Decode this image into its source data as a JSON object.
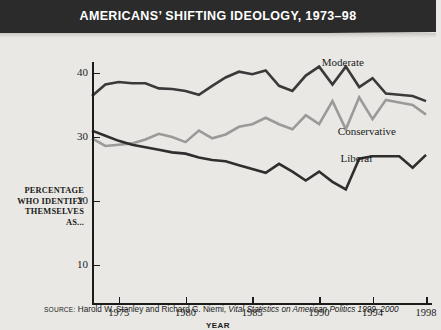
{
  "banner": {
    "title": "AMERICANS’ SHIFTING IDEOLOGY, 1973–98",
    "background_color": "#2b2b2b",
    "text_color": "#ffffff"
  },
  "source": {
    "prefix": "SOURCE:",
    "authors": "Harold W. Stanley and Richard G. Niemi,",
    "work": "Vital Statistics on American Politics 1999–2000"
  },
  "chart_data": {
    "type": "line",
    "title": "AMERICANS’ SHIFTING IDEOLOGY, 1973–98",
    "xlabel": "YEAR",
    "ylabel": "PERCENTAGE WHO IDENTIFY THEMSELVES AS...",
    "ylabel_lines": [
      "PERCENTAGE",
      "WHO IDENTIFY",
      "THEMSELVES",
      "AS..."
    ],
    "xlim": [
      1973,
      1998
    ],
    "ylim": [
      10,
      42
    ],
    "yticks": [
      10,
      20,
      30,
      40
    ],
    "xticks": [
      1975,
      1980,
      1985,
      1990,
      1994,
      1998
    ],
    "grid": false,
    "legend_position": "inline",
    "x": [
      1973,
      1974,
      1975,
      1976,
      1977,
      1978,
      1979,
      1980,
      1981,
      1982,
      1983,
      1984,
      1985,
      1986,
      1987,
      1988,
      1989,
      1990,
      1991,
      1992,
      1993,
      1994,
      1995,
      1996,
      1997,
      1998
    ],
    "series": [
      {
        "name": "Moderate",
        "color": "#3a3a3a",
        "label_x": 1990.2,
        "label_y": 41.6,
        "values": [
          36.4,
          38.2,
          38.6,
          38.4,
          38.4,
          37.6,
          37.5,
          37.2,
          36.6,
          38.0,
          39.3,
          40.2,
          39.8,
          40.4,
          38.0,
          37.2,
          39.6,
          41.0,
          38.2,
          41.0,
          37.8,
          39.2,
          36.8,
          36.6,
          36.4,
          35.6
        ]
      },
      {
        "name": "Conservative",
        "color": "#9a9a9a",
        "label_x": 1991.4,
        "label_y": 30.8,
        "values": [
          29.8,
          28.6,
          28.8,
          29.0,
          29.6,
          30.5,
          30.0,
          29.2,
          31.0,
          29.8,
          30.4,
          31.6,
          32.0,
          33.0,
          32.0,
          31.2,
          33.4,
          32.0,
          35.6,
          31.2,
          36.2,
          32.8,
          35.8,
          35.4,
          35.0,
          33.5
        ]
      },
      {
        "name": "Liberal",
        "color": "#2e2e2e",
        "label_x": 1991.6,
        "label_y": 26.6,
        "values": [
          31.0,
          30.2,
          29.4,
          28.8,
          28.4,
          28.0,
          27.6,
          27.4,
          26.8,
          26.4,
          26.2,
          25.6,
          25.0,
          24.4,
          25.8,
          24.6,
          23.2,
          24.6,
          23.0,
          21.8,
          26.6,
          27.0,
          27.0,
          27.0,
          25.2,
          27.2
        ]
      }
    ]
  }
}
